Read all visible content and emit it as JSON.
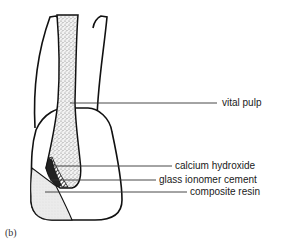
{
  "figure": {
    "panel_label": "(b)",
    "colors": {
      "outline": "#111111",
      "leader_line": "#333333",
      "pulp_stipple": "#8a8a8a",
      "composite_fill": "#e4e4e4"
    }
  },
  "labels": [
    {
      "id": "vital-pulp",
      "text": "vital pulp"
    },
    {
      "id": "calcium-hydroxide",
      "text": "calcium hydroxide"
    },
    {
      "id": "glass-ionomer-cement",
      "text": "glass ionomer cement"
    },
    {
      "id": "composite-resin",
      "text": "composite resin"
    }
  ]
}
